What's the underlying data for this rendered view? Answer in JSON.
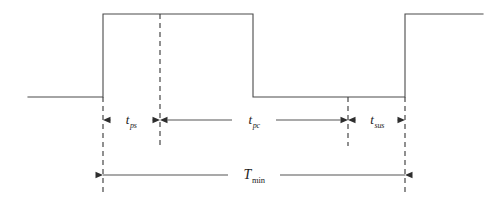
{
  "figure": {
    "kind": "timing-diagram",
    "background_color": "#ffffff",
    "line_color": "#4a4a4a",
    "dash_color": "#3f3f3f",
    "arrow_color": "#2e2e2e",
    "canvas": {
      "width": 504,
      "height": 208
    }
  },
  "waveform": {
    "name": "pulse-waveform",
    "low_level_y": 97,
    "high_level_y": 14,
    "start_x": 28,
    "end_x": 483,
    "edges": [
      {
        "name": "rising-edge-1",
        "x": 103,
        "direction": "rising"
      },
      {
        "name": "falling-edge-1",
        "x": 253,
        "direction": "falling"
      },
      {
        "name": "rising-edge-2",
        "x": 405,
        "direction": "rising"
      }
    ]
  },
  "guides": [
    {
      "name": "guide-left",
      "x": 103,
      "y1": 97,
      "y2": 196
    },
    {
      "name": "guide-mid",
      "x": 160,
      "y1": 14,
      "y2": 146
    },
    {
      "name": "guide-sus",
      "x": 348,
      "y1": 97,
      "y2": 146
    },
    {
      "name": "guide-right",
      "x": 405,
      "y1": 97,
      "y2": 196
    }
  ],
  "dimensions": {
    "row_upper_y": 120,
    "row_lower_y": 175,
    "items": [
      {
        "name": "dimension-t-ps",
        "symbol": "t",
        "subscript": "ps",
        "label": "t_ps",
        "x1": 103,
        "x2": 160,
        "y": 120,
        "label_x": 131,
        "label_y": 119,
        "arrows": "outward"
      },
      {
        "name": "dimension-t-pc",
        "symbol": "t",
        "subscript": "pc",
        "label": "t_pc",
        "x1": 160,
        "x2": 348,
        "y": 120,
        "label_x": 254,
        "label_y": 119,
        "arrows": "outward"
      },
      {
        "name": "dimension-t-sus",
        "symbol": "t",
        "subscript": "sus",
        "label": "t_sus",
        "x1": 348,
        "x2": 405,
        "y": 120,
        "label_x": 377,
        "label_y": 119,
        "arrows": "outward"
      },
      {
        "name": "dimension-T-min",
        "symbol": "T",
        "subscript": "min",
        "label": "T_min",
        "x1": 103,
        "x2": 405,
        "y": 175,
        "label_x": 254,
        "label_y": 174,
        "arrows": "inward"
      }
    ]
  }
}
